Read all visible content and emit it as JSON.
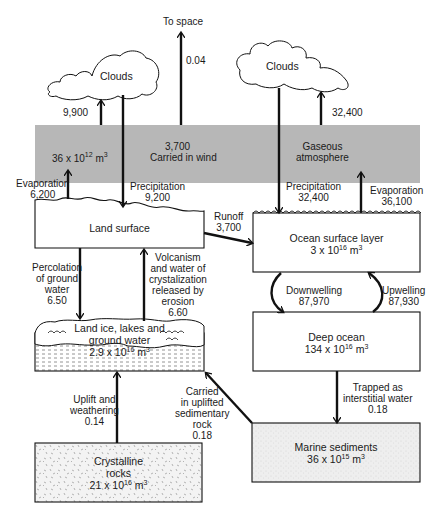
{
  "diagram": {
    "type": "flow",
    "colors": {
      "atmosphere_fill": "#b7b7b7",
      "line": "#111111",
      "box_fill": "#ffffff",
      "sediment_fill": "#ececec"
    },
    "nodes": {
      "clouds_left": {
        "label": "Clouds"
      },
      "clouds_right": {
        "label": "Clouds"
      },
      "to_space": {
        "label": "To space"
      },
      "atmosphere": {
        "label_line1": "Gaseous",
        "label_line2": "atmosphere",
        "volume_base": "36 x 10",
        "volume_exp": "12",
        "volume_unit": " m",
        "volume_unit_exp": "3"
      },
      "land_surface": {
        "label": "Land surface"
      },
      "ocean_surface": {
        "label": "Ocean surface layer",
        "volume_base": "3 x 10",
        "volume_exp": "16",
        "volume_unit": " m",
        "volume_unit_exp": "3"
      },
      "deep_ocean": {
        "label": "Deep ocean",
        "volume_base": "134 x 10",
        "volume_exp": "16",
        "volume_unit": " m",
        "volume_unit_exp": "3"
      },
      "land_ice": {
        "label_line1": "Land ice, lakes and",
        "label_line2": "ground water",
        "volume_base": "2.9 x 10",
        "volume_exp": "16",
        "volume_unit": " m",
        "volume_unit_exp": "3"
      },
      "crystalline_rocks": {
        "label_line1": "Crystalline",
        "label_line2": "rocks",
        "volume_base": "21 x 10",
        "volume_exp": "16",
        "volume_unit": " m",
        "volume_unit_exp": "3"
      },
      "marine_sediments": {
        "label": "Marine sediments",
        "volume_base": "36 x 10",
        "volume_exp": "15",
        "volume_unit": " m",
        "volume_unit_exp": "3"
      }
    },
    "flows": {
      "land_atm_to_clouds": {
        "value": "9,900"
      },
      "to_space": {
        "value": "0.04"
      },
      "wind": {
        "value": "3,700",
        "label": "Carried in wind"
      },
      "ocean_atm_to_clouds": {
        "value": "32,400"
      },
      "land_evaporation": {
        "label": "Evaporation",
        "value": "6,200"
      },
      "land_precipitation": {
        "label": "Precipitation",
        "value": "9,200"
      },
      "ocean_precipitation": {
        "label": "Precipitation",
        "value": "32,400"
      },
      "ocean_evaporation": {
        "label": "Evaporation",
        "value": "36,100"
      },
      "runoff": {
        "label": "Runoff",
        "value": "3,700"
      },
      "percolation": {
        "line1": "Percolation",
        "line2": "of ground",
        "line3": "water",
        "value": "6.50"
      },
      "volcanism": {
        "line1": "Volcanism",
        "line2": "and water of",
        "line3": "crystalization",
        "line4": "released by",
        "line5": "erosion",
        "value": "6.60"
      },
      "downwelling": {
        "label": "Downwelling",
        "value": "87,970"
      },
      "upwelling": {
        "label": "Upwelling",
        "value": "87,930"
      },
      "uplift": {
        "line1": "Uplift and",
        "line2": "weathering",
        "value": "0.14"
      },
      "sedimentary": {
        "line1": "Carried",
        "line2": "in uplifted",
        "line3": "sedimentary",
        "line4": "rock",
        "value": "0.18"
      },
      "trapped": {
        "line1": "Trapped as",
        "line2": "interstitial water",
        "value": "0.18"
      }
    }
  }
}
